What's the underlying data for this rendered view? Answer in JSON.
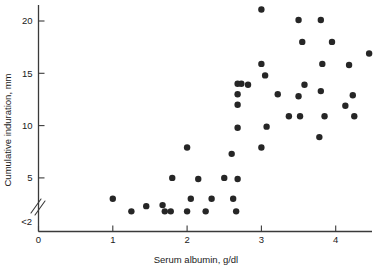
{
  "chart_data": {
    "type": "scatter",
    "title": "",
    "xlabel": "Serum albumin, g/dl",
    "ylabel": "Cumulative induration, mm",
    "xlim": [
      0,
      4.55
    ],
    "ylim": [
      1.4,
      21.6
    ],
    "grid": false,
    "legend": null,
    "xticks": [
      0,
      1,
      2,
      3,
      4
    ],
    "xtick_labels": [
      "0",
      "1",
      "2",
      "3",
      "4"
    ],
    "yticks": [
      5,
      10,
      15,
      20
    ],
    "ytick_labels": [
      "5",
      "10",
      "15",
      "20"
    ],
    "y_axis_break": true,
    "y_floor_label": "<2",
    "y_floor_value": 1.8,
    "marker": "filled-circle",
    "marker_color": "#262626",
    "marker_size_px": 4.4,
    "points": [
      {
        "x": 1.0,
        "y": 3.0
      },
      {
        "x": 1.25,
        "y": 1.8
      },
      {
        "x": 1.45,
        "y": 2.3
      },
      {
        "x": 1.67,
        "y": 2.4
      },
      {
        "x": 1.7,
        "y": 1.8
      },
      {
        "x": 1.78,
        "y": 1.8
      },
      {
        "x": 1.8,
        "y": 5.0
      },
      {
        "x": 2.0,
        "y": 1.8
      },
      {
        "x": 2.0,
        "y": 7.9
      },
      {
        "x": 2.05,
        "y": 3.0
      },
      {
        "x": 2.15,
        "y": 4.9
      },
      {
        "x": 2.25,
        "y": 1.8
      },
      {
        "x": 2.33,
        "y": 3.0
      },
      {
        "x": 2.5,
        "y": 5.0
      },
      {
        "x": 2.6,
        "y": 7.3
      },
      {
        "x": 2.62,
        "y": 3.0
      },
      {
        "x": 2.66,
        "y": 1.8
      },
      {
        "x": 2.68,
        "y": 4.9
      },
      {
        "x": 2.68,
        "y": 9.8
      },
      {
        "x": 2.68,
        "y": 12.0
      },
      {
        "x": 2.68,
        "y": 13.0
      },
      {
        "x": 2.68,
        "y": 14.0
      },
      {
        "x": 2.73,
        "y": 14.0
      },
      {
        "x": 2.82,
        "y": 13.9
      },
      {
        "x": 3.0,
        "y": 21.1
      },
      {
        "x": 3.0,
        "y": 15.9
      },
      {
        "x": 3.0,
        "y": 7.9
      },
      {
        "x": 3.05,
        "y": 14.8
      },
      {
        "x": 3.07,
        "y": 9.9
      },
      {
        "x": 3.22,
        "y": 13.0
      },
      {
        "x": 3.37,
        "y": 10.9
      },
      {
        "x": 3.5,
        "y": 20.1
      },
      {
        "x": 3.5,
        "y": 12.8
      },
      {
        "x": 3.52,
        "y": 10.9
      },
      {
        "x": 3.55,
        "y": 18.0
      },
      {
        "x": 3.58,
        "y": 13.9
      },
      {
        "x": 3.78,
        "y": 8.9
      },
      {
        "x": 3.8,
        "y": 20.1
      },
      {
        "x": 3.8,
        "y": 13.3
      },
      {
        "x": 3.82,
        "y": 15.9
      },
      {
        "x": 3.85,
        "y": 10.9
      },
      {
        "x": 3.95,
        "y": 18.0
      },
      {
        "x": 4.13,
        "y": 11.9
      },
      {
        "x": 4.18,
        "y": 15.8
      },
      {
        "x": 4.23,
        "y": 12.9
      },
      {
        "x": 4.25,
        "y": 10.9
      },
      {
        "x": 4.45,
        "y": 16.9
      }
    ]
  }
}
